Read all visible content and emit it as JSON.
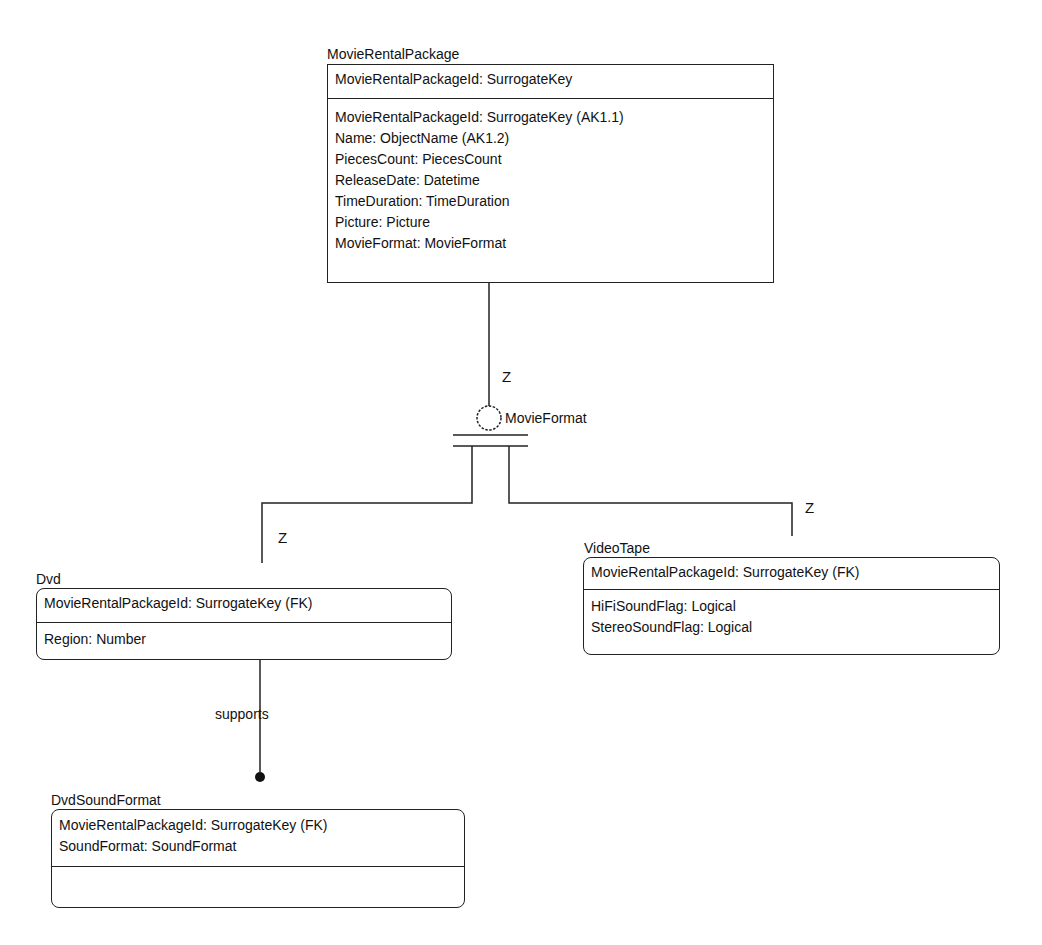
{
  "entities": {
    "movie_rental_package": {
      "name": "MovieRentalPackage",
      "keys": [
        "MovieRentalPackageId: SurrogateKey"
      ],
      "attributes": [
        "MovieRentalPackageId: SurrogateKey (AK1.1)",
        "Name: ObjectName (AK1.2)",
        "PiecesCount: PiecesCount",
        "ReleaseDate: Datetime",
        "TimeDuration: TimeDuration",
        "Picture: Picture",
        "MovieFormat: MovieFormat"
      ]
    },
    "dvd": {
      "name": "Dvd",
      "keys": [
        "MovieRentalPackageId: SurrogateKey (FK)"
      ],
      "attributes": [
        "Region: Number"
      ]
    },
    "video_tape": {
      "name": "VideoTape",
      "keys": [
        "MovieRentalPackageId: SurrogateKey (FK)"
      ],
      "attributes": [
        "HiFiSoundFlag: Logical",
        "StereoSoundFlag: Logical"
      ]
    },
    "dvd_sound_format": {
      "name": "DvdSoundFormat",
      "keys": [
        "MovieRentalPackageId: SurrogateKey (FK)",
        "SoundFormat: SoundFormat"
      ],
      "attributes": []
    }
  },
  "relationships": {
    "category": {
      "discriminator": "MovieFormat",
      "parent_cardinality": "Z",
      "dvd_cardinality": "Z",
      "videotape_cardinality": "Z"
    },
    "dvd_supports": {
      "verb": "supports"
    }
  },
  "colors": {
    "line": "#222222",
    "background": "#ffffff"
  }
}
